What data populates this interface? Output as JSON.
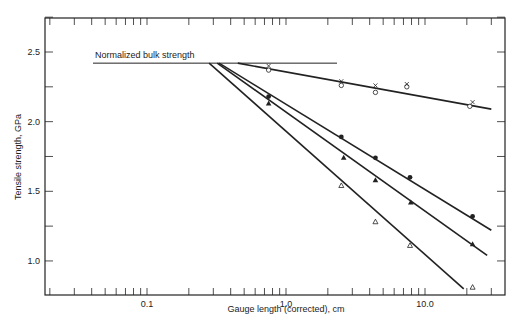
{
  "chart_data": {
    "type": "scatter",
    "title": "",
    "xlabel": "Gauge length (corrected), cm",
    "ylabel": "Tensile strength, GPa",
    "xscale": "log",
    "xlim": [
      0.045,
      35
    ],
    "ylim": [
      0.75,
      2.75
    ],
    "x_tick_labels": [
      "0.1",
      "1.0",
      "10.0"
    ],
    "y_tick_labels": [
      "1.0",
      "1.5",
      "2.0",
      "2.5"
    ],
    "grid": false,
    "annotations": [
      {
        "text": "Normalized bulk strength",
        "type": "horizontal-line",
        "y": 2.42,
        "x_range": [
          0.04,
          2.4
        ]
      }
    ],
    "series": [
      {
        "name": "open circles",
        "marker": "o",
        "x": [
          0.75,
          2.5,
          4.4,
          7.4,
          21
        ],
        "y": [
          2.37,
          2.26,
          2.21,
          2.25,
          2.11
        ]
      },
      {
        "name": "crosses",
        "marker": "x",
        "x": [
          0.75,
          2.5,
          4.4,
          7.4,
          22
        ],
        "y": [
          2.4,
          2.29,
          2.26,
          2.27,
          2.14
        ]
      },
      {
        "name": "filled circles",
        "marker": "filled-circle",
        "x": [
          0.75,
          2.5,
          4.4,
          7.8,
          22
        ],
        "y": [
          2.18,
          1.89,
          1.74,
          1.6,
          1.32
        ]
      },
      {
        "name": "filled triangles",
        "marker": "filled-triangle",
        "x": [
          0.75,
          2.6,
          4.4,
          7.9,
          22
        ],
        "y": [
          2.13,
          1.74,
          1.58,
          1.42,
          1.12
        ]
      },
      {
        "name": "open triangles",
        "marker": "open-triangle",
        "x": [
          2.5,
          4.4,
          7.8,
          22
        ],
        "y": [
          1.54,
          1.28,
          1.11,
          0.81
        ]
      }
    ],
    "fit_lines": [
      {
        "name": "circles/crosses fit",
        "from": [
          0.45,
          2.42
        ],
        "to": [
          30,
          2.09
        ]
      },
      {
        "name": "filled circles fit",
        "from": [
          0.33,
          2.42
        ],
        "to": [
          30,
          1.22
        ]
      },
      {
        "name": "filled triangles fit",
        "from": [
          0.32,
          2.42
        ],
        "to": [
          28,
          1.04
        ]
      },
      {
        "name": "open triangles fit",
        "from": [
          0.28,
          2.42
        ],
        "to": [
          19,
          0.8
        ]
      }
    ]
  }
}
